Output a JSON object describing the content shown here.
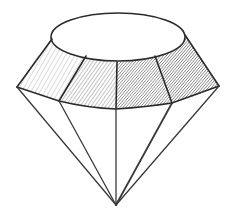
{
  "image": {
    "subject": "Pencil sketch of a diamond",
    "colors": {
      "background": "#ffffff",
      "line": "#2a2a2a",
      "shade_dark": "#555555",
      "shade_light": "#9a9a9a"
    }
  }
}
